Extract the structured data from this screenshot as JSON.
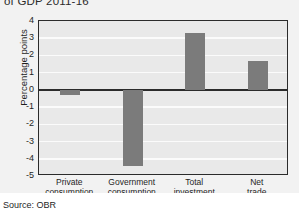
{
  "figure": {
    "title": "of GDP 2011-16",
    "source": "Source: OBR",
    "bar_color": "#7b7b7b",
    "plot_background": "#e9e9e9",
    "gridline_color": "#fbfbfb",
    "frame_color": "#2b2b2b"
  },
  "chart_data": {
    "type": "bar",
    "title": "of GDP 2011-16",
    "categories": [
      "Private\nconsumption",
      "Government\nconsumption",
      "Total\ninvestment",
      "Net\ntrade"
    ],
    "category_lines": [
      [
        "Private",
        "consumption"
      ],
      [
        "Government",
        "consumption"
      ],
      [
        "Total",
        "investment"
      ],
      [
        "Net",
        "trade"
      ]
    ],
    "values": [
      -0.3,
      -4.4,
      3.3,
      1.7
    ],
    "xlabel": "",
    "ylabel": "Percentage points",
    "ylim": [
      -5,
      4
    ],
    "yticks": [
      4,
      3,
      2,
      1,
      0,
      -1,
      -2,
      -3,
      -4,
      -5
    ],
    "ytick_labels": [
      "4",
      "3",
      "2",
      "1",
      "0",
      "-1",
      "-2",
      "-3",
      "-4",
      "-5"
    ],
    "grid": true,
    "legend": false,
    "legend_position": "none",
    "annotations": [
      "Source: OBR"
    ]
  }
}
